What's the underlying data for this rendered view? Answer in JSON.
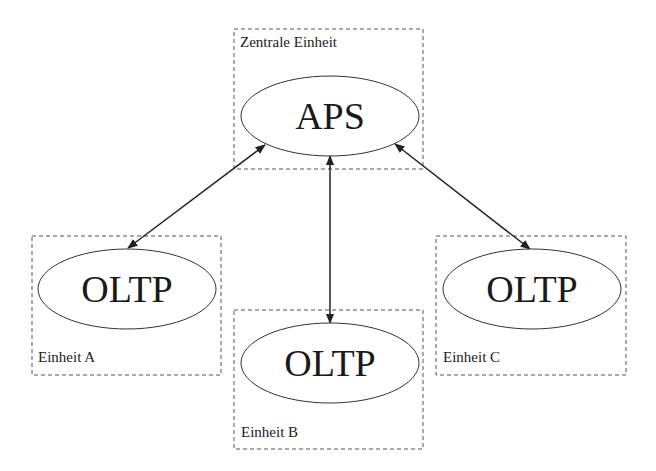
{
  "diagram": {
    "units": [
      {
        "id": "zentral",
        "label": "Zentrale Einheit",
        "node_label": "APS"
      },
      {
        "id": "a",
        "label": "Einheit A",
        "node_label": "OLTP"
      },
      {
        "id": "b",
        "label": "Einheit B",
        "node_label": "OLTP"
      },
      {
        "id": "c",
        "label": "Einheit C",
        "node_label": "OLTP"
      }
    ],
    "edges": [
      {
        "from": "APS",
        "to": "OLTP (Einheit A)",
        "direction": "bidirectional"
      },
      {
        "from": "APS",
        "to": "OLTP (Einheit B)",
        "direction": "bidirectional"
      },
      {
        "from": "APS",
        "to": "OLTP (Einheit C)",
        "direction": "bidirectional"
      }
    ],
    "colors": {
      "line": "#222222",
      "box_border": "#555555",
      "background": "#ffffff"
    }
  }
}
